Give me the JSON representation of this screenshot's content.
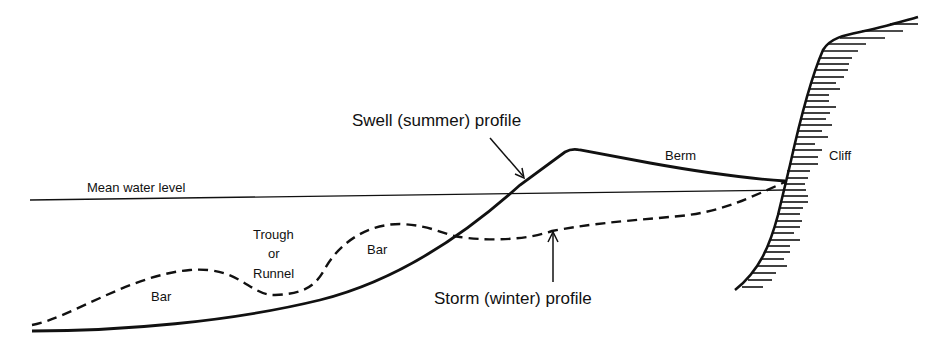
{
  "diagram": {
    "type": "beach-profile",
    "colors": {
      "ink": "#111111",
      "background": "#ffffff"
    },
    "labels": {
      "mean_water_level": "Mean water level",
      "swell_profile": "Swell (summer) profile",
      "storm_profile": "Storm (winter) profile",
      "berm": "Berm",
      "cliff": "Cliff",
      "bar_offshore": "Bar",
      "bar_inshore": "Bar",
      "trough_line1": "Trough",
      "trough_line2": "or",
      "trough_line3": "Runnel"
    },
    "line_styles": {
      "swell_profile": "solid",
      "storm_profile": "dashed",
      "mean_water_level": "solid-thin"
    }
  }
}
